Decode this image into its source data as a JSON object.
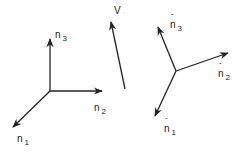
{
  "diagram": {
    "title": "",
    "frames": [
      {
        "name": "original-frame",
        "vectors": [
          {
            "id": "n1",
            "symbol": "n",
            "subscript": "1",
            "hat": false
          },
          {
            "id": "n2",
            "symbol": "n",
            "subscript": "2",
            "hat": false
          },
          {
            "id": "n3",
            "symbol": "n",
            "subscript": "3",
            "hat": false
          }
        ]
      },
      {
        "name": "rotated-frame",
        "vectors": [
          {
            "id": "n1hat",
            "symbol": "n",
            "subscript": "1",
            "hat": true
          },
          {
            "id": "n2hat",
            "symbol": "n",
            "subscript": "2",
            "hat": true
          },
          {
            "id": "n3hat",
            "symbol": "n",
            "subscript": "3",
            "hat": true
          }
        ]
      }
    ],
    "vector_v": {
      "symbol": "V"
    },
    "line_color": "#222222"
  }
}
